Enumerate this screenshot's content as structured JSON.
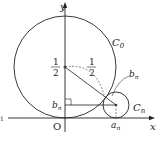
{
  "diagram": {
    "type": "geometry",
    "axes": {
      "x_label": "x",
      "y_label": "y",
      "origin_label": "O"
    },
    "circles": [
      {
        "name": "C_0",
        "label_main": "C",
        "label_sub": "0",
        "center": [
          0,
          0.5
        ],
        "radius": 0.5
      },
      {
        "name": "C_n",
        "label_main": "C",
        "label_sub": "n",
        "center": [
          "a_n",
          "b_n"
        ],
        "radius": "b_n"
      }
    ],
    "labels": {
      "half_num": "1",
      "half_den": "2",
      "center_y_num": "1",
      "center_y_den": "2",
      "bn_left_main": "b",
      "bn_left_sub": "n",
      "bn_right_main": "b",
      "bn_right_sub": "n",
      "an_main": "a",
      "an_sub": "n",
      "left_edge_fragment": "1"
    },
    "colors": {
      "stroke": "#222222",
      "dashed": "#555555",
      "background": "#ffffff"
    }
  }
}
